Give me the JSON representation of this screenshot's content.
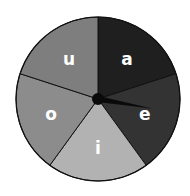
{
  "spinner": {
    "center": [
      98,
      99
    ],
    "radius": 82,
    "needle_angle_deg": 100,
    "sections": [
      {
        "label": "a",
        "color": "#1f1f1f",
        "start": 0,
        "end": 72
      },
      {
        "label": "e",
        "color": "#333333",
        "start": 72,
        "end": 144
      },
      {
        "label": "i",
        "color": "#b2b2b2",
        "start": 144,
        "end": 216
      },
      {
        "label": "o",
        "color": "#8c8c8c",
        "start": 216,
        "end": 288
      },
      {
        "label": "u",
        "color": "#7e7e7e",
        "start": 288,
        "end": 360
      }
    ],
    "outline_color": "#111111",
    "needle_color": "#0a0a0a"
  }
}
